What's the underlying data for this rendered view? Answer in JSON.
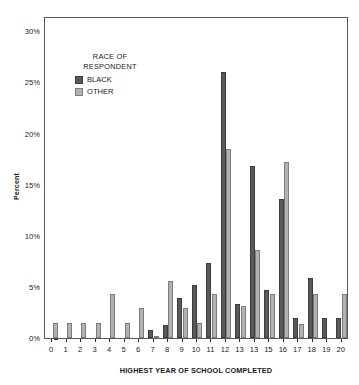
{
  "chart_data": {
    "type": "bar",
    "title": "",
    "xlabel": "HIGHEST YEAR OF SCHOOL COMPLETED",
    "ylabel": "Percent",
    "categories": [
      "0",
      "1",
      "2",
      "3",
      "4",
      "5",
      "6",
      "7",
      "8",
      "9",
      "10",
      "11",
      "12",
      "13",
      "13",
      "15",
      "16",
      "17",
      "18",
      "19",
      "20"
    ],
    "series": [
      {
        "name": "BLACK",
        "color": "#595959",
        "values": [
          0,
          0,
          0,
          0,
          0,
          0,
          0,
          0.8,
          1.3,
          3.9,
          5.2,
          7.3,
          26.0,
          3.3,
          16.8,
          4.7,
          13.6,
          2.0,
          5.9,
          2.0,
          2.0
        ]
      },
      {
        "name": "OTHER",
        "color": "#b2b2b2",
        "values": [
          1.5,
          1.5,
          1.5,
          1.5,
          4.3,
          1.5,
          2.9,
          0.15,
          5.6,
          2.9,
          1.5,
          4.3,
          18.5,
          3.1,
          8.6,
          4.3,
          17.2,
          1.4,
          4.3,
          0,
          4.3
        ]
      }
    ],
    "ylim": [
      0,
      31.5
    ],
    "yticks": [
      0,
      5,
      10,
      15,
      20,
      25,
      30
    ],
    "ytick_labels": [
      "0%",
      "5%",
      "10%",
      "15%",
      "20%",
      "25%",
      "30%"
    ],
    "grid": false,
    "legend_position": "inside-upper-left",
    "legend": {
      "title_line1": "RACE OF",
      "title_line2": "RESPONDENT",
      "entries": [
        "BLACK",
        "OTHER"
      ]
    }
  }
}
